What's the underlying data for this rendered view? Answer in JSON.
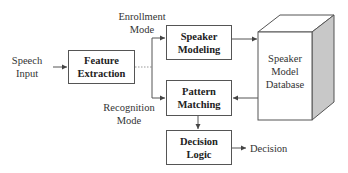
{
  "diagram": {
    "inputs": {
      "speech_input": "Speech\nInput"
    },
    "modes": {
      "enrollment": "Enrollment\nMode",
      "recognition": "Recognition\nMode"
    },
    "blocks": {
      "feature_extraction": "Feature\nExtraction",
      "speaker_modeling": "Speaker\nModeling",
      "pattern_matching": "Pattern\nMatching",
      "decision_logic": "Decision\nLogic",
      "database": "Speaker\nModel\nDatabase"
    },
    "outputs": {
      "decision": "Decision"
    },
    "colors": {
      "line": "#555555",
      "db_side": "#c8c8c8",
      "db_top": "#ffffff"
    }
  }
}
